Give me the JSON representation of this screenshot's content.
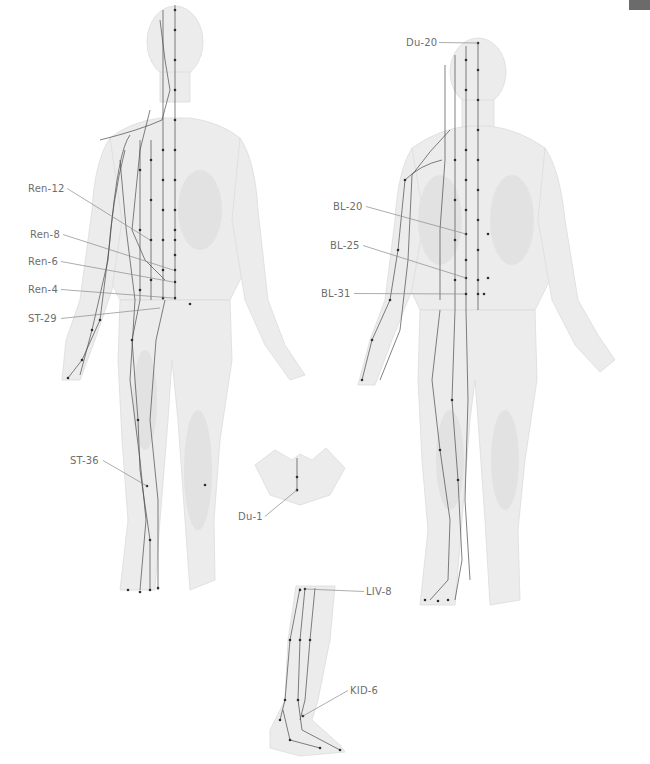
{
  "page": {
    "corner_tab_color": "#6b6b6b",
    "background": "#ffffff"
  },
  "figures": {
    "front": {
      "name": "front-view-body",
      "labels": [
        {
          "id": "ren-12",
          "text": "Ren-12",
          "x": 28,
          "y": 192,
          "tx": 150,
          "ty": 240
        },
        {
          "id": "ren-8",
          "text": "Ren-8",
          "x": 30,
          "y": 238,
          "tx": 173,
          "ty": 270
        },
        {
          "id": "ren-6",
          "text": "Ren-6",
          "x": 28,
          "y": 265,
          "tx": 173,
          "ty": 282
        },
        {
          "id": "ren-4",
          "text": "Ren-4",
          "x": 28,
          "y": 293,
          "tx": 173,
          "ty": 298
        },
        {
          "id": "st-29",
          "text": "ST-29",
          "x": 28,
          "y": 322,
          "tx": 160,
          "ty": 308
        },
        {
          "id": "st-36",
          "text": "ST-36",
          "x": 70,
          "y": 464,
          "tx": 147,
          "ty": 486
        }
      ]
    },
    "back": {
      "name": "back-view-body",
      "labels": [
        {
          "id": "du-20",
          "text": "Du-20",
          "x": 406,
          "y": 46,
          "tx": 478,
          "ty": 43
        },
        {
          "id": "bl-20",
          "text": "BL-20",
          "x": 333,
          "y": 210,
          "tx": 466,
          "ty": 234
        },
        {
          "id": "bl-25",
          "text": "BL-25",
          "x": 330,
          "y": 249,
          "tx": 466,
          "ty": 278
        },
        {
          "id": "bl-31",
          "text": "BL-31",
          "x": 321,
          "y": 297,
          "tx": 465,
          "ty": 294
        }
      ]
    },
    "perineum": {
      "name": "perineum-inset",
      "labels": [
        {
          "id": "du-1",
          "text": "Du-1",
          "x": 238,
          "y": 520,
          "tx": 297,
          "ty": 490
        }
      ]
    },
    "leg": {
      "name": "medial-leg-inset",
      "labels": [
        {
          "id": "liv-8",
          "text": "LIV-8",
          "x": 366,
          "y": 595,
          "tx": 305,
          "ty": 589
        },
        {
          "id": "kid-6",
          "text": "KID-6",
          "x": 350,
          "y": 694,
          "tx": 303,
          "ty": 716
        }
      ]
    }
  }
}
